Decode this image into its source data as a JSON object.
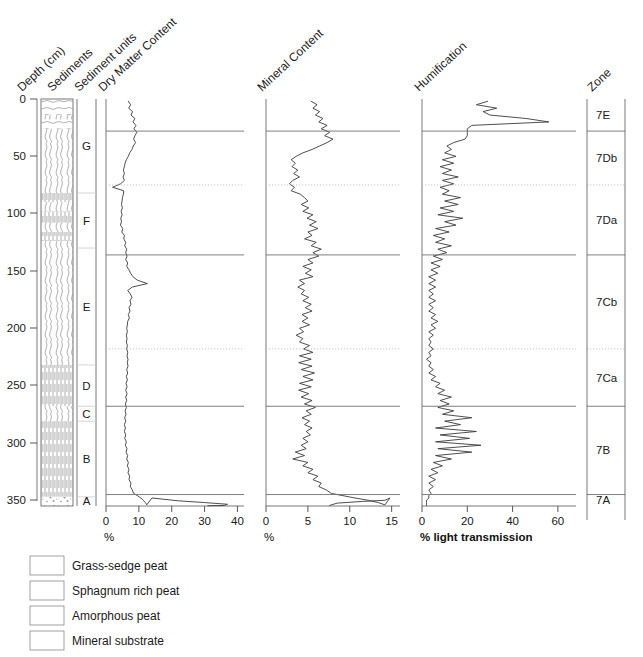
{
  "figure": {
    "headers": [
      {
        "key": "depth",
        "label": "Depth (cm)"
      },
      {
        "key": "sediments",
        "label": "Sediments"
      },
      {
        "key": "units",
        "label": "Sediment units"
      },
      {
        "key": "dmc",
        "label": "Dry Matter Content"
      },
      {
        "key": "min",
        "label": "Mineral Content"
      },
      {
        "key": "hum",
        "label": "Humification"
      },
      {
        "key": "zone",
        "label": "Zone"
      }
    ],
    "depth_axis": {
      "label": "Depth (cm)",
      "ticks": [
        0,
        50,
        100,
        150,
        200,
        250,
        300,
        350
      ],
      "min": 0,
      "max": 355
    },
    "sediment_units": [
      {
        "label": "G",
        "top": 0,
        "bottom": 82
      },
      {
        "label": "F",
        "top": 82,
        "bottom": 130
      },
      {
        "label": "E",
        "top": 130,
        "bottom": 232
      },
      {
        "label": "D",
        "top": 232,
        "bottom": 268
      },
      {
        "label": "C",
        "top": 268,
        "bottom": 281
      },
      {
        "label": "B",
        "top": 281,
        "bottom": 347
      },
      {
        "label": "A",
        "top": 347,
        "bottom": 355
      }
    ],
    "zones": [
      {
        "label": "7E",
        "top": 0,
        "bottom": 28,
        "boundary": "solid"
      },
      {
        "label": "7Db",
        "top": 28,
        "bottom": 75,
        "boundary": "dotted"
      },
      {
        "label": "7Da",
        "top": 75,
        "bottom": 136,
        "boundary": "solid"
      },
      {
        "label": "7Cb",
        "top": 136,
        "bottom": 218,
        "boundary": "dotted"
      },
      {
        "label": "7Ca",
        "top": 218,
        "bottom": 268,
        "boundary": "solid"
      },
      {
        "label": "7B",
        "top": 268,
        "bottom": 345,
        "boundary": "solid"
      },
      {
        "label": "7A",
        "top": 345,
        "bottom": 355,
        "boundary": "none"
      }
    ],
    "lithology": [
      {
        "type": "sphagnum-rich-peat",
        "top": 0,
        "bottom": 14
      },
      {
        "type": "grass-sedge-peat",
        "top": 14,
        "bottom": 18
      },
      {
        "type": "sphagnum-rich-peat",
        "top": 18,
        "bottom": 26
      },
      {
        "type": "grass-sedge-peat",
        "top": 26,
        "bottom": 82
      },
      {
        "type": "amorphous-peat",
        "top": 82,
        "bottom": 90
      },
      {
        "type": "grass-sedge-peat",
        "top": 90,
        "bottom": 98
      },
      {
        "type": "amorphous-peat",
        "top": 98,
        "bottom": 108
      },
      {
        "type": "grass-sedge-peat",
        "top": 108,
        "bottom": 116
      },
      {
        "type": "amorphous-peat",
        "top": 116,
        "bottom": 124
      },
      {
        "type": "grass-sedge-peat",
        "top": 124,
        "bottom": 232
      },
      {
        "type": "amorphous-peat",
        "top": 232,
        "bottom": 268
      },
      {
        "type": "grass-sedge-peat",
        "top": 268,
        "bottom": 281
      },
      {
        "type": "amorphous-peat",
        "top": 281,
        "bottom": 347
      },
      {
        "type": "mineral-substrate",
        "top": 347,
        "bottom": 355
      }
    ],
    "legend": [
      {
        "key": "grass-sedge-peat",
        "label": "Grass-sedge peat"
      },
      {
        "key": "sphagnum-rich-peat",
        "label": "Sphagnum rich peat"
      },
      {
        "key": "amorphous-peat",
        "label": "Amorphous peat"
      },
      {
        "key": "mineral-substrate",
        "label": "Mineral substrate"
      }
    ]
  },
  "chart_data": [
    {
      "type": "line",
      "title": "Dry Matter Content",
      "xlabel": "%",
      "ylabel": "Depth (cm)",
      "xlim": [
        0,
        42
      ],
      "ylim": [
        0,
        355
      ],
      "xticks": [
        0,
        10,
        20,
        30,
        40
      ],
      "yticks": [
        0,
        50,
        100,
        150,
        200,
        250,
        300,
        350
      ],
      "grid": true,
      "orientation": "vertical-depth",
      "series": [
        {
          "name": "Dry Matter Content",
          "depth": [
            2,
            5,
            8,
            11,
            14,
            17,
            20,
            23,
            26,
            29,
            32,
            35,
            38,
            41,
            44,
            47,
            50,
            53,
            56,
            59,
            62,
            65,
            68,
            71,
            74,
            77,
            80,
            83,
            86,
            89,
            92,
            95,
            98,
            101,
            104,
            107,
            110,
            113,
            116,
            119,
            122,
            125,
            128,
            131,
            134,
            137,
            140,
            143,
            146,
            149,
            152,
            155,
            158,
            161,
            164,
            167,
            170,
            173,
            176,
            179,
            182,
            185,
            188,
            191,
            194,
            197,
            200,
            203,
            206,
            209,
            212,
            215,
            218,
            221,
            224,
            227,
            230,
            233,
            236,
            239,
            242,
            245,
            248,
            251,
            254,
            257,
            260,
            263,
            266,
            269,
            272,
            275,
            278,
            281,
            284,
            287,
            290,
            293,
            296,
            299,
            302,
            305,
            308,
            311,
            314,
            317,
            320,
            323,
            326,
            329,
            332,
            335,
            338,
            341,
            344,
            346,
            348,
            350,
            352,
            354
          ],
          "values": [
            6.8,
            7.5,
            6.9,
            8.1,
            7.6,
            8.8,
            8.2,
            9.1,
            8.5,
            9.4,
            8.8,
            8.4,
            9.0,
            8.3,
            7.9,
            7.2,
            6.8,
            6.2,
            5.8,
            5.6,
            5.3,
            5.6,
            5.2,
            5.6,
            4.4,
            2.0,
            5.4,
            5.3,
            5.0,
            4.9,
            4.7,
            5.0,
            4.6,
            4.9,
            4.5,
            4.7,
            4.4,
            5.1,
            4.8,
            5.6,
            5.4,
            6.0,
            5.7,
            6.3,
            6.0,
            6.4,
            6.0,
            6.6,
            6.3,
            7.0,
            7.5,
            8.2,
            9.5,
            12.6,
            8.0,
            6.6,
            7.4,
            7.9,
            7.3,
            7.6,
            7.0,
            7.3,
            6.8,
            7.1,
            6.6,
            6.5,
            6.3,
            6.5,
            6.2,
            6.4,
            6.2,
            6.5,
            6.3,
            6.6,
            6.4,
            6.7,
            6.5,
            6.7,
            6.3,
            6.6,
            6.2,
            6.5,
            6.1,
            6.4,
            6.0,
            6.4,
            6.0,
            6.3,
            5.9,
            6.2,
            5.8,
            6.1,
            5.7,
            6.0,
            5.6,
            5.9,
            5.6,
            6.0,
            5.7,
            6.2,
            5.9,
            6.4,
            6.1,
            6.6,
            6.3,
            6.8,
            6.5,
            7.0,
            6.7,
            7.2,
            7.0,
            7.6,
            7.4,
            8.0,
            8.4,
            9.6,
            10.6,
            11.3,
            12.0,
            12.4
          ]
        }
      ],
      "note": "Below 347 cm the curve rises steeply to a maximum near 37% at the mineral substrate."
    },
    {
      "type": "line",
      "title": "Mineral Content",
      "xlabel": "%",
      "xlim": [
        0,
        16
      ],
      "ylim": [
        0,
        355
      ],
      "xticks": [
        0,
        5,
        10,
        15
      ],
      "yticks": [
        0,
        50,
        100,
        150,
        200,
        250,
        300,
        350
      ],
      "grid": true,
      "orientation": "vertical-depth",
      "series": [
        {
          "name": "Mineral Content",
          "depth": [
            2,
            5,
            8,
            11,
            14,
            17,
            20,
            23,
            26,
            29,
            32,
            35,
            38,
            41,
            44,
            47,
            50,
            53,
            56,
            59,
            62,
            65,
            68,
            71,
            74,
            77,
            80,
            83,
            86,
            89,
            92,
            95,
            98,
            101,
            104,
            107,
            110,
            113,
            116,
            119,
            122,
            125,
            128,
            131,
            134,
            137,
            140,
            143,
            146,
            149,
            152,
            155,
            158,
            161,
            164,
            167,
            170,
            173,
            176,
            179,
            182,
            185,
            188,
            191,
            194,
            197,
            200,
            203,
            206,
            209,
            212,
            215,
            218,
            221,
            224,
            227,
            230,
            233,
            236,
            239,
            242,
            245,
            248,
            251,
            254,
            257,
            260,
            263,
            266,
            269,
            272,
            275,
            278,
            281,
            284,
            287,
            290,
            293,
            296,
            299,
            302,
            305,
            308,
            311,
            314,
            317,
            320,
            323,
            326,
            329,
            332,
            335,
            338,
            341,
            344,
            346,
            348,
            350,
            352,
            354
          ],
          "values": [
            5.4,
            6.1,
            5.6,
            6.4,
            5.9,
            6.8,
            6.3,
            7.3,
            6.6,
            7.6,
            7.0,
            8.0,
            7.3,
            6.4,
            5.5,
            4.4,
            3.6,
            3.0,
            3.5,
            3.1,
            3.8,
            3.3,
            4.0,
            3.2,
            2.8,
            3.4,
            3.0,
            4.1,
            4.6,
            5.0,
            4.2,
            5.1,
            4.4,
            5.6,
            4.9,
            6.0,
            5.2,
            6.2,
            5.0,
            5.5,
            4.6,
            6.0,
            5.4,
            6.6,
            5.6,
            6.3,
            5.0,
            5.6,
            4.4,
            5.4,
            4.7,
            5.6,
            4.0,
            4.6,
            3.8,
            4.6,
            4.2,
            5.1,
            4.4,
            5.4,
            4.7,
            5.5,
            4.3,
            5.0,
            4.3,
            5.2,
            4.0,
            4.5,
            3.6,
            4.4,
            4.0,
            5.2,
            4.5,
            5.6,
            4.0,
            5.4,
            3.9,
            5.5,
            4.2,
            5.8,
            4.4,
            5.6,
            4.0,
            5.4,
            3.9,
            5.1,
            4.2,
            5.5,
            4.6,
            5.9,
            4.8,
            5.4,
            4.3,
            5.2,
            4.6,
            5.5,
            4.8,
            5.3,
            4.4,
            5.0,
            4.2,
            4.8,
            3.5,
            4.6,
            3.2,
            5.0,
            4.4,
            5.6,
            5.0,
            6.2,
            5.6,
            6.6,
            6.3,
            7.2,
            7.8,
            9.2,
            10.6,
            12.2,
            13.4,
            14.2
          ]
        }
      ],
      "note": "Below ~347 cm the curve reaches a broad maximum near 14-15% in the mineral substrate."
    },
    {
      "type": "line",
      "title": "Humification",
      "xlabel": "% light transmission",
      "xlim": [
        0,
        68
      ],
      "ylim": [
        0,
        355
      ],
      "xticks": [
        0,
        20,
        40,
        60
      ],
      "yticks": [
        0,
        50,
        100,
        150,
        200,
        250,
        300,
        350
      ],
      "grid": true,
      "orientation": "vertical-depth",
      "series": [
        {
          "name": "Humification",
          "depth": [
            2,
            5,
            8,
            11,
            14,
            17,
            20,
            23,
            26,
            29,
            32,
            35,
            38,
            41,
            44,
            47,
            50,
            53,
            56,
            59,
            62,
            65,
            68,
            71,
            74,
            77,
            80,
            83,
            86,
            89,
            92,
            95,
            98,
            101,
            104,
            107,
            110,
            113,
            116,
            119,
            122,
            125,
            128,
            131,
            134,
            137,
            140,
            143,
            146,
            149,
            152,
            155,
            158,
            161,
            164,
            167,
            170,
            173,
            176,
            179,
            182,
            185,
            188,
            191,
            194,
            197,
            200,
            203,
            206,
            209,
            212,
            215,
            218,
            221,
            224,
            227,
            230,
            233,
            236,
            239,
            242,
            245,
            248,
            251,
            254,
            257,
            260,
            263,
            266,
            269,
            272,
            275,
            278,
            281,
            284,
            287,
            290,
            293,
            296,
            299,
            302,
            305,
            308,
            311,
            314,
            317,
            320,
            323,
            326,
            329,
            332,
            335,
            338,
            341,
            344,
            346,
            348,
            350,
            352,
            354
          ],
          "values": [
            29,
            24,
            33,
            27,
            30,
            46,
            56,
            22,
            20,
            20,
            20,
            19,
            14,
            11,
            13,
            10,
            15,
            9,
            14,
            8,
            13,
            9,
            16,
            9,
            14,
            8,
            12,
            9,
            17,
            10,
            16,
            8,
            14,
            7,
            18,
            10,
            15,
            6,
            12,
            5,
            10,
            6,
            13,
            7,
            11,
            5,
            9,
            4,
            8,
            4,
            7,
            3,
            6,
            3,
            6,
            3,
            5,
            3,
            6,
            3,
            5,
            3,
            6,
            4,
            7,
            4,
            6,
            3,
            5,
            3,
            4,
            3,
            5,
            3,
            4,
            2,
            4,
            3,
            5,
            3,
            6,
            4,
            8,
            6,
            10,
            7,
            13,
            8,
            12,
            7,
            14,
            9,
            22,
            10,
            17,
            6,
            24,
            8,
            21,
            6,
            26,
            7,
            22,
            6,
            13,
            5,
            9,
            4,
            7,
            3,
            6,
            3,
            5,
            3,
            4,
            3,
            3,
            2,
            2,
            2
          ]
        }
      ],
      "note": "Uppermost 20 cm shows very high light transmission (up to ~62%)."
    }
  ]
}
